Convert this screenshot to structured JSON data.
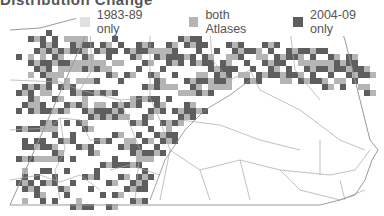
{
  "title": "Distribution Change",
  "legend": {
    "items": [
      {
        "label": "1983-89 only",
        "color": "#e0e0e0"
      },
      {
        "label": "both Atlases",
        "color": "#b5b5b5"
      },
      {
        "label": "2004-09 only",
        "color": "#5e5e5e"
      }
    ]
  },
  "map": {
    "region": "Pennsylvania",
    "outline_color": "#9a9a9a",
    "county_line_color": "#a8a8a8",
    "cell_size": 6,
    "cells": [
      [
        1,
        5,
        20,
        2
      ],
      [
        1,
        11,
        14,
        2
      ],
      [
        1,
        14,
        20,
        2
      ],
      [
        1,
        17,
        18,
        2
      ],
      [
        1,
        22,
        11,
        2
      ],
      [
        1,
        26,
        6,
        2
      ],
      [
        2,
        10,
        21,
        2
      ],
      [
        2,
        13,
        19,
        2
      ],
      [
        2,
        19,
        16,
        2
      ],
      [
        2,
        20,
        11,
        2
      ],
      [
        2,
        24,
        12,
        1
      ],
      [
        2,
        25,
        8,
        2
      ],
      [
        2,
        27,
        14,
        2
      ],
      [
        2,
        29,
        20,
        1
      ],
      [
        3,
        2,
        22,
        2
      ],
      [
        3,
        5,
        16,
        1
      ],
      [
        3,
        6,
        19,
        2
      ],
      [
        3,
        8,
        24,
        1
      ],
      [
        3,
        12,
        21,
        2
      ],
      [
        3,
        14,
        23,
        2
      ],
      [
        3,
        17,
        18,
        2
      ],
      [
        3,
        20,
        9,
        2
      ],
      [
        4,
        4,
        6,
        2
      ],
      [
        4,
        7,
        14,
        2
      ],
      [
        4,
        10,
        10,
        2
      ],
      [
        4,
        13,
        12,
        1
      ],
      [
        4,
        17,
        10,
        2
      ],
      [
        4,
        19,
        16,
        2
      ],
      [
        4,
        22,
        11,
        1
      ],
      [
        4,
        25,
        12,
        2
      ],
      [
        4,
        28,
        21,
        2
      ],
      [
        5,
        3,
        10,
        2
      ],
      [
        5,
        5,
        16,
        1
      ],
      [
        5,
        8,
        18,
        2
      ],
      [
        5,
        11,
        21,
        1
      ],
      [
        5,
        16,
        22,
        2
      ],
      [
        5,
        19,
        20,
        2
      ],
      [
        5,
        24,
        17,
        2
      ],
      [
        5,
        26,
        14,
        2
      ],
      [
        5,
        29,
        8,
        2
      ],
      [
        6,
        1,
        4,
        2
      ],
      [
        6,
        4,
        15,
        2
      ],
      [
        6,
        6,
        18,
        2
      ],
      [
        6,
        9,
        9,
        2
      ],
      [
        6,
        14,
        10,
        2
      ],
      [
        6,
        17,
        21,
        1
      ],
      [
        6,
        20,
        17,
        2
      ],
      [
        6,
        24,
        16,
        2
      ],
      [
        7,
        2,
        12,
        2
      ],
      [
        7,
        5,
        9,
        2
      ],
      [
        7,
        8,
        21,
        1
      ],
      [
        7,
        12,
        17,
        2
      ],
      [
        7,
        18,
        16,
        2
      ],
      [
        7,
        21,
        21,
        2
      ],
      [
        7,
        25,
        8,
        2
      ],
      [
        7,
        29,
        20,
        2
      ],
      [
        8,
        4,
        10,
        2
      ],
      [
        8,
        7,
        11,
        1
      ],
      [
        8,
        10,
        18,
        2
      ],
      [
        8,
        14,
        21,
        2
      ],
      [
        8,
        19,
        22,
        2
      ],
      [
        8,
        22,
        12,
        2
      ],
      [
        8,
        27,
        13,
        2
      ],
      [
        9,
        2,
        7,
        1
      ],
      [
        9,
        6,
        18,
        2
      ],
      [
        9,
        9,
        20,
        1
      ],
      [
        9,
        13,
        15,
        2
      ],
      [
        9,
        16,
        24,
        2
      ],
      [
        9,
        24,
        20,
        2
      ],
      [
        9,
        28,
        16,
        2
      ],
      [
        10,
        3,
        18,
        2
      ],
      [
        10,
        6,
        22,
        1
      ],
      [
        10,
        11,
        11,
        2
      ],
      [
        10,
        18,
        8,
        2
      ],
      [
        10,
        22,
        12,
        2
      ],
      [
        10,
        26,
        24,
        2
      ],
      [
        10,
        30,
        11,
        2
      ],
      [
        11,
        4,
        9,
        2
      ],
      [
        11,
        9,
        19,
        1
      ],
      [
        11,
        13,
        13,
        2
      ],
      [
        11,
        16,
        17,
        2
      ],
      [
        11,
        20,
        14,
        2
      ],
      [
        11,
        29,
        8,
        1
      ],
      [
        12,
        5,
        21,
        2
      ],
      [
        12,
        7,
        10,
        2
      ],
      [
        12,
        12,
        16,
        1
      ],
      [
        12,
        14,
        23,
        2
      ],
      [
        12,
        17,
        13,
        2
      ],
      [
        12,
        25,
        18,
        2
      ],
      [
        13,
        3,
        16,
        2
      ],
      [
        13,
        6,
        14,
        1
      ],
      [
        13,
        11,
        23,
        2
      ],
      [
        13,
        15,
        22,
        2
      ],
      [
        13,
        21,
        21,
        2
      ],
      [
        13,
        27,
        24,
        2
      ],
      [
        14,
        4,
        7,
        2
      ],
      [
        14,
        9,
        16,
        2
      ],
      [
        14,
        13,
        17,
        1
      ],
      [
        14,
        19,
        9,
        2
      ],
      [
        14,
        24,
        12,
        2
      ],
      [
        14,
        31,
        10,
        2
      ],
      [
        15,
        3,
        13,
        2
      ],
      [
        15,
        7,
        9,
        1
      ],
      [
        15,
        11,
        18,
        2
      ],
      [
        15,
        15,
        11,
        2
      ],
      [
        15,
        23,
        23,
        2
      ],
      [
        15,
        28,
        12,
        2
      ],
      [
        16,
        5,
        8,
        2
      ],
      [
        16,
        8,
        25,
        2
      ],
      [
        16,
        14,
        6,
        2
      ],
      [
        16,
        19,
        24,
        2
      ],
      [
        16,
        26,
        13,
        2
      ],
      [
        16,
        30,
        17,
        2
      ],
      [
        17,
        2,
        20,
        2
      ],
      [
        17,
        6,
        13,
        1
      ],
      [
        17,
        13,
        23,
        2
      ],
      [
        17,
        18,
        17,
        2
      ],
      [
        17,
        22,
        12,
        2
      ],
      [
        17,
        28,
        25,
        2
      ],
      [
        18,
        3,
        16,
        2
      ],
      [
        18,
        9,
        8,
        2
      ],
      [
        18,
        15,
        17,
        1
      ],
      [
        18,
        20,
        15,
        2
      ],
      [
        18,
        25,
        13,
        2
      ],
      [
        19,
        4,
        11,
        2
      ],
      [
        19,
        8,
        21,
        2
      ],
      [
        19,
        13,
        18,
        2
      ],
      [
        19,
        19,
        9,
        1
      ],
      [
        19,
        23,
        22,
        2
      ],
      [
        19,
        27,
        15,
        2
      ],
      [
        20,
        5,
        9,
        2
      ],
      [
        20,
        12,
        18,
        1
      ],
      [
        20,
        16,
        14,
        2
      ],
      [
        20,
        21,
        18,
        2
      ],
      [
        20,
        26,
        10,
        2
      ],
      [
        20,
        29,
        14,
        2
      ],
      [
        21,
        3,
        10,
        2
      ],
      [
        21,
        7,
        24,
        2
      ],
      [
        21,
        12,
        7,
        2
      ],
      [
        21,
        18,
        12,
        2
      ],
      [
        21,
        22,
        22,
        1
      ],
      [
        21,
        25,
        14,
        2
      ],
      [
        22,
        6,
        9,
        2
      ],
      [
        22,
        10,
        15,
        2
      ],
      [
        22,
        15,
        13,
        2
      ],
      [
        22,
        19,
        21,
        2
      ],
      [
        22,
        24,
        16,
        2
      ],
      [
        23,
        4,
        11,
        1
      ],
      [
        23,
        8,
        13,
        2
      ],
      [
        23,
        14,
        10,
        2
      ],
      [
        23,
        17,
        24,
        2
      ],
      [
        23,
        21,
        18,
        2
      ],
      [
        24,
        5,
        15,
        2
      ],
      [
        24,
        9,
        9,
        2
      ],
      [
        24,
        13,
        17,
        2
      ],
      [
        24,
        18,
        11,
        2
      ],
      [
        24,
        20,
        16,
        2
      ],
      [
        25,
        7,
        8,
        2
      ],
      [
        25,
        10,
        14,
        1
      ],
      [
        25,
        16,
        15,
        2
      ],
      [
        25,
        19,
        10,
        2
      ],
      [
        26,
        3,
        17,
        2
      ],
      [
        26,
        6,
        10,
        2
      ],
      [
        26,
        12,
        12,
        2
      ],
      [
        26,
        17,
        24,
        1
      ],
      [
        27,
        4,
        16,
        2
      ],
      [
        27,
        8,
        12,
        2
      ],
      [
        27,
        14,
        7,
        2
      ],
      [
        27,
        16,
        13,
        2
      ],
      [
        28,
        2,
        15,
        2
      ],
      [
        28,
        5,
        18,
        2
      ],
      [
        28,
        11,
        11,
        1
      ],
      [
        28,
        15,
        10,
        2
      ],
      [
        29,
        3,
        19,
        2
      ],
      [
        29,
        9,
        6,
        2
      ],
      [
        29,
        13,
        13,
        2
      ],
      [
        30,
        6,
        11,
        2
      ],
      [
        30,
        10,
        17,
        2
      ],
      [
        30,
        14,
        22,
        2
      ],
      [
        31,
        4,
        12,
        2
      ],
      [
        31,
        8,
        9,
        1
      ],
      [
        31,
        11,
        14,
        2
      ],
      [
        32,
        5,
        17,
        2
      ],
      [
        32,
        9,
        10,
        2
      ],
      [
        33,
        7,
        11,
        2
      ],
      [
        33,
        10,
        15,
        1
      ],
      [
        34,
        4,
        12,
        2
      ],
      [
        34,
        8,
        18,
        2
      ],
      [
        35,
        6,
        9,
        2
      ],
      [
        35,
        9,
        13,
        2
      ],
      [
        36,
        3,
        14,
        2
      ],
      [
        36,
        5,
        10,
        1
      ],
      [
        37,
        4,
        11,
        2
      ],
      [
        37,
        7,
        16,
        2
      ],
      [
        38,
        5,
        12,
        2
      ],
      [
        38,
        8,
        13,
        1
      ],
      [
        39,
        6,
        16,
        2
      ],
      [
        39,
        9,
        10,
        2
      ],
      [
        40,
        4,
        9,
        2
      ],
      [
        40,
        7,
        12,
        2
      ],
      [
        41,
        5,
        13,
        1
      ],
      [
        41,
        8,
        14,
        2
      ],
      [
        42,
        3,
        14,
        2
      ],
      [
        42,
        6,
        10,
        2
      ],
      [
        43,
        4,
        12,
        2
      ],
      [
        43,
        7,
        13,
        2
      ],
      [
        44,
        5,
        10,
        2
      ],
      [
        44,
        8,
        15,
        2
      ],
      [
        45,
        6,
        12,
        2
      ],
      [
        45,
        9,
        9,
        1
      ],
      [
        46,
        4,
        11,
        2
      ],
      [
        46,
        7,
        16,
        2
      ],
      [
        47,
        5,
        9,
        2
      ],
      [
        47,
        8,
        13,
        2
      ],
      [
        48,
        6,
        11,
        1
      ],
      [
        48,
        9,
        14,
        2
      ],
      [
        49,
        4,
        15,
        2
      ],
      [
        49,
        7,
        10,
        2
      ],
      [
        50,
        5,
        8,
        2
      ],
      [
        50,
        8,
        12,
        2
      ],
      [
        51,
        6,
        14,
        1
      ],
      [
        51,
        9,
        9,
        2
      ],
      [
        52,
        7,
        11,
        2
      ],
      [
        52,
        10,
        13,
        2
      ],
      [
        53,
        5,
        9,
        2
      ],
      [
        53,
        8,
        12,
        2
      ],
      [
        54,
        6,
        10,
        2
      ],
      [
        54,
        9,
        13,
        1
      ],
      [
        55,
        7,
        11,
        2
      ],
      [
        55,
        10,
        12,
        2
      ],
      [
        56,
        5,
        9,
        2
      ],
      [
        56,
        8,
        10,
        2
      ],
      [
        57,
        6,
        12,
        2
      ],
      [
        57,
        9,
        8,
        2
      ],
      [
        58,
        7,
        13,
        2
      ],
      [
        58,
        10,
        9,
        1
      ],
      [
        59,
        8,
        10,
        2
      ],
      [
        59,
        11,
        11,
        2
      ]
    ]
  }
}
